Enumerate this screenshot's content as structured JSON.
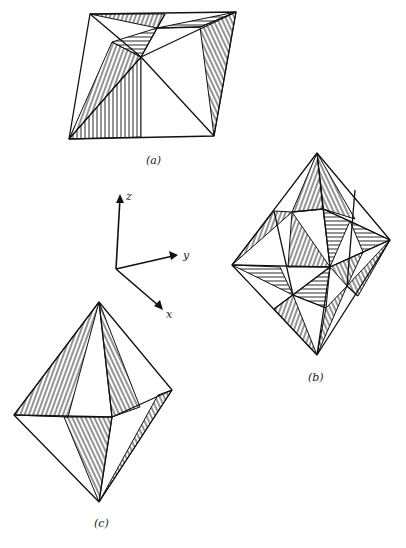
{
  "figure_labels": {
    "a": "(a)",
    "b": "(b)",
    "c": "(c)"
  },
  "axes": {
    "z": "z",
    "y": "y",
    "x": "x"
  },
  "figures": [
    {
      "id": "a",
      "description": "Tilted quadrilateral projection of octahedron with hatched triangular facets"
    },
    {
      "id": "b",
      "description": "Diamond-shaped octahedron view with subdivided hatched facets"
    },
    {
      "id": "c",
      "description": "Octahedron with four hatched facets"
    }
  ]
}
